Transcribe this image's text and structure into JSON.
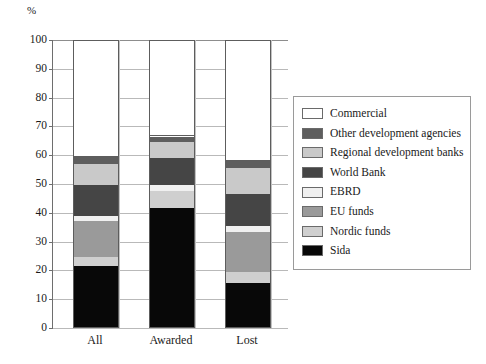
{
  "chart_data": {
    "type": "bar",
    "subtype": "stacked-vertical-percent",
    "title": "",
    "xlabel": "",
    "ylabel": "%",
    "unit_label": "%",
    "categories": [
      "All",
      "Awarded",
      "Lost"
    ],
    "ylim": [
      0,
      100
    ],
    "yticks": [
      0,
      10,
      20,
      30,
      40,
      50,
      60,
      70,
      80,
      90,
      100
    ],
    "ytick_labels": [
      "0",
      "10",
      "20",
      "30",
      "40",
      "50",
      "60",
      "70",
      "80",
      "90",
      "100"
    ],
    "grid": true,
    "legend_position": "right",
    "stack_order_bottom_to_top": [
      "Sida",
      "Nordic funds",
      "EU funds",
      "EBRD",
      "World Bank",
      "Regional development banks",
      "Other development agencies",
      "Commercial"
    ],
    "series": [
      {
        "name": "Sida",
        "color": "#080808",
        "values": [
          21.5,
          41.5,
          15.5
        ]
      },
      {
        "name": "Nordic funds",
        "color": "#cfcfcf",
        "values": [
          3.0,
          6.0,
          4.0
        ]
      },
      {
        "name": "EU funds",
        "color": "#9a9a9a",
        "values": [
          12.5,
          0.0,
          14.0
        ]
      },
      {
        "name": "EBRD",
        "color": "#f0f0f0",
        "values": [
          2.0,
          2.0,
          2.0
        ]
      },
      {
        "name": "World Bank",
        "color": "#454545",
        "values": [
          10.5,
          9.5,
          11.0
        ]
      },
      {
        "name": "Regional development banks",
        "color": "#c9c9c9",
        "values": [
          7.5,
          5.5,
          9.0
        ]
      },
      {
        "name": "Other development agencies",
        "color": "#5e5e5e",
        "values": [
          2.5,
          2.0,
          2.5
        ]
      },
      {
        "name": "Commercial",
        "color": "#ffffff",
        "values": [
          40.5,
          33.5,
          42.0
        ]
      }
    ],
    "cumulative_tops": {
      "All": {
        "Sida": 21.5,
        "Nordic funds": 24.5,
        "EU funds": 37.0,
        "EBRD": 39.0,
        "World Bank": 49.5,
        "Regional development banks": 57.0,
        "Other development agencies": 59.5,
        "Commercial": 100
      },
      "Awarded": {
        "Sida": 41.5,
        "Nordic funds": 47.5,
        "EU funds": 47.5,
        "EBRD": 49.5,
        "World Bank": 59.0,
        "Regional development banks": 64.5,
        "Other development agencies": 66.5,
        "Commercial": 100
      },
      "Lost": {
        "Sida": 15.5,
        "Nordic funds": 19.5,
        "EU funds": 33.5,
        "EBRD": 35.5,
        "World Bank": 46.5,
        "Regional development banks": 55.5,
        "Other development agencies": 58.0,
        "Commercial": 100
      }
    }
  },
  "legend": {
    "items": [
      {
        "label": "Commercial",
        "swatch": "commercial"
      },
      {
        "label": "Other development agencies",
        "swatch": "otherdev"
      },
      {
        "label": "Regional development banks",
        "swatch": "regional"
      },
      {
        "label": "World Bank",
        "swatch": "worldbank"
      },
      {
        "label": "EBRD",
        "swatch": "ebrd"
      },
      {
        "label": "EU funds",
        "swatch": "eufunds"
      },
      {
        "label": "Nordic funds",
        "swatch": "nordic"
      },
      {
        "label": "Sida",
        "swatch": "sida"
      }
    ]
  }
}
